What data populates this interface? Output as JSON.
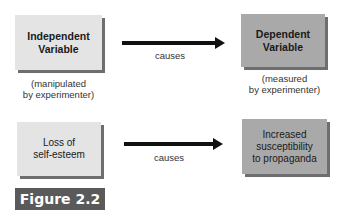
{
  "diagram": {
    "row1": {
      "left_box": {
        "line1": "Independent",
        "line2": "Variable",
        "caption1": "(manipulated",
        "caption2": "by experimenter)"
      },
      "arrow_label": "causes",
      "right_box": {
        "line1": "Dependent",
        "line2": "Variable",
        "caption1": "(measured",
        "caption2": "by experimenter)"
      }
    },
    "row2": {
      "left_box": {
        "line1": "Loss of",
        "line2": "self-esteem"
      },
      "arrow_label": "causes",
      "right_box": {
        "line1": "Increased",
        "line2": "susceptibility",
        "line3": "to propaganda"
      }
    },
    "figure_label": "Figure 2.2"
  }
}
